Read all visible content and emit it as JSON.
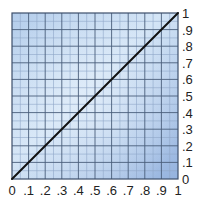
{
  "chart_data": {
    "type": "line",
    "title": "",
    "xlabel": "",
    "ylabel": "",
    "xlim": [
      0,
      1
    ],
    "ylim": [
      0,
      1
    ],
    "grid": true,
    "grid_major_step": 0.1,
    "grid_minor_step": 0.05,
    "x_tick_labels": [
      "0",
      ".1",
      ".2",
      ".3",
      ".4",
      ".5",
      ".6",
      ".7",
      ".8",
      ".9",
      "1"
    ],
    "y_tick_labels": [
      "0",
      ".1",
      ".2",
      ".3",
      ".4",
      ".5",
      ".6",
      ".7",
      ".8",
      ".9",
      "1"
    ],
    "y_axis_position": "right",
    "legend": null,
    "series": [
      {
        "name": "y = x",
        "x": [
          0,
          1
        ],
        "y": [
          0,
          1
        ],
        "color": "#111111"
      }
    ]
  },
  "colors": {
    "background_light": "#d6e6f7",
    "background_dark": "#9bb8e0",
    "grid_major": "#4a5d7a",
    "grid_minor": "#8ea6c8",
    "border": "#3d4f6b",
    "line": "#111111"
  }
}
